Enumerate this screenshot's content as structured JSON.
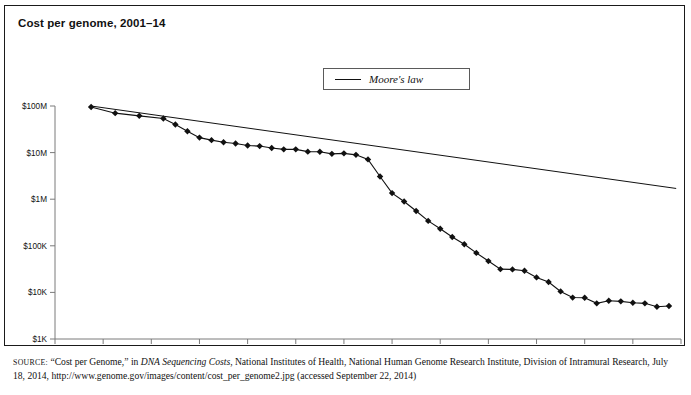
{
  "title": "Cost per genome, 2001–14",
  "legend": {
    "label": "Moore's law",
    "position": "top-center",
    "line_color": "#111111"
  },
  "source": {
    "prefix": "SOURCE:",
    "part1": " “Cost per Genome,” in ",
    "italic": "DNA Sequencing Costs",
    "part2": ", National Institutes of Health, National Human Genome Research Institute, Division of Intramural Research, July 18, 2014, http://www.genome.gov/images/content/cost_per_genome2.jpg (accessed September 22, 2014)"
  },
  "chart_data": {
    "type": "line",
    "title": "Cost per genome, 2001–14",
    "xlabel": "",
    "ylabel": "",
    "yscale": "log",
    "ylim": [
      1000,
      100000000
    ],
    "ytick_values": [
      100000000,
      10000000,
      1000000,
      100000,
      10000,
      1000
    ],
    "ytick_labels": [
      "$100M",
      "$10M",
      "$1M",
      "$100K",
      "$10K",
      "$1K"
    ],
    "xlim": [
      2001,
      2014
    ],
    "xtick_labels": [
      "2001",
      "2002",
      "2003",
      "2004",
      "2005",
      "2006",
      "2007",
      "2008",
      "2009",
      "2010",
      "2011",
      "2012",
      "2013",
      "2014"
    ],
    "grid": false,
    "series": [
      {
        "name": "Cost per genome",
        "marker": "diamond",
        "color": "#111111",
        "x": [
          2001.75,
          2002.25,
          2002.75,
          2003.25,
          2003.5,
          2003.75,
          2004.0,
          2004.25,
          2004.5,
          2004.75,
          2005.0,
          2005.25,
          2005.5,
          2005.75,
          2006.0,
          2006.25,
          2006.5,
          2006.75,
          2007.0,
          2007.25,
          2007.5,
          2007.75,
          2008.0,
          2008.25,
          2008.5,
          2008.75,
          2009.0,
          2009.25,
          2009.5,
          2009.75,
          2010.0,
          2010.25,
          2010.5,
          2010.75,
          2011.0,
          2011.25,
          2011.5,
          2011.75,
          2012.0,
          2012.25,
          2012.5,
          2012.75,
          2013.0,
          2013.25,
          2013.5,
          2013.75
        ],
        "y": [
          95263072,
          70175437,
          61448422,
          53751684,
          40157554,
          28780376,
          20963375,
          18519312,
          16712371,
          15642796,
          14173509,
          13801124,
          12585140,
          11732535,
          11732535,
          10474556,
          10458000,
          9408739,
          9635232,
          8950000,
          7147571,
          3063820,
          1352982,
          892149,
          558000,
          342502,
          232735,
          154714,
          108065,
          70333,
          47000,
          31512,
          31125,
          29092,
          20963,
          16712,
          10497,
          7743,
          7666,
          5826,
          6618,
          6424,
          5985,
          5826,
          4905,
          5096
        ]
      },
      {
        "name": "Moore's law",
        "marker": "none",
        "color": "#111111",
        "x": [
          2001.75,
          2013.9
        ],
        "y": [
          100000000,
          1700000
        ]
      }
    ],
    "annotations": [
      "Cost drops from roughly $95M in 2001 to about $5K in late 2013",
      "Plateau near $10M–$20M from 2004 through mid-2007",
      "Steep decline beginning late 2007 outpaces Moore's law",
      "Slight uptick at the final data point"
    ]
  }
}
